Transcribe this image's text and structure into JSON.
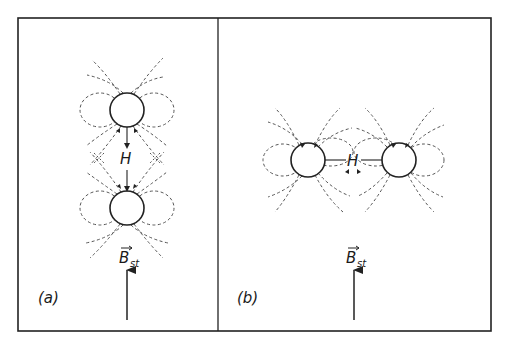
{
  "figure": {
    "panels": [
      {
        "id": "a",
        "label": "(a)",
        "field_label": "B",
        "field_subscript": "st",
        "center_label": "H",
        "arrangement": "vertical",
        "spheres": [
          {
            "cx": 127,
            "cy": 110,
            "r": 17
          },
          {
            "cx": 127,
            "cy": 208,
            "r": 17
          }
        ]
      },
      {
        "id": "b",
        "label": "(b)",
        "field_label": "B",
        "field_subscript": "st",
        "center_label": "H",
        "arrangement": "horizontal",
        "spheres": [
          {
            "cx": 308,
            "cy": 160,
            "r": 17
          },
          {
            "cx": 399,
            "cy": 160,
            "r": 17
          }
        ]
      }
    ],
    "colors": {
      "line": "#222222",
      "dash": "#555555",
      "background": "#ffffff"
    }
  }
}
